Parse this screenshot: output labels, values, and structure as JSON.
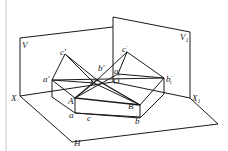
{
  "diagram": {
    "type": "descriptive-geometry-projection",
    "planes": [
      {
        "id": "V",
        "label": "V"
      },
      {
        "id": "V1",
        "label": "V",
        "subscript": "1"
      },
      {
        "id": "H",
        "label": "H"
      }
    ],
    "axes": [
      {
        "id": "X",
        "label": "X"
      },
      {
        "id": "X1",
        "label": "X",
        "subscript": "1"
      }
    ],
    "points": [
      {
        "id": "A",
        "label": "A"
      },
      {
        "id": "B",
        "label": "B"
      },
      {
        "id": "C",
        "label": "C"
      },
      {
        "id": "O",
        "label": "O"
      }
    ],
    "projections": {
      "horizontal": [
        {
          "label": "a"
        },
        {
          "label": "b"
        },
        {
          "label": "c"
        }
      ],
      "frontal": [
        {
          "label": "a'"
        },
        {
          "label": "b'"
        },
        {
          "label": "c'"
        }
      ],
      "auxiliary": [
        {
          "label": "a",
          "sup": "'",
          "sub": "1"
        },
        {
          "label": "b",
          "sup": "'",
          "sub": "1"
        },
        {
          "label": "c",
          "sup": "'",
          "sub": "1"
        }
      ]
    }
  },
  "colors": {
    "line": "#1a1a1a",
    "border": "#bbbbbb"
  }
}
